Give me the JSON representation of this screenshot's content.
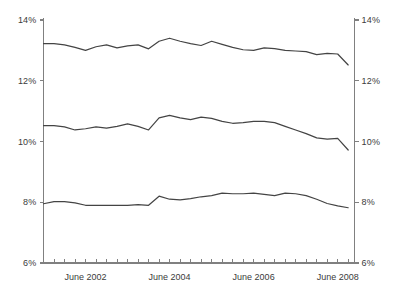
{
  "chart_data": {
    "type": "line",
    "title": "",
    "subtitle": "",
    "xlabel": "",
    "ylabel": "",
    "ylim": [
      6,
      14
    ],
    "ytick_labels": [
      "14%",
      "12%",
      "10%",
      "8%",
      "6%"
    ],
    "ytick_values": [
      14,
      12,
      10,
      8,
      6
    ],
    "ytick_labels_right": [
      "14%",
      "12%",
      "10%",
      "8%",
      "6%"
    ],
    "xtick_labels": [
      "June 2002",
      "June 2004",
      "June 2006",
      "June 2008"
    ],
    "xtick_values": [
      2002.5,
      2004.5,
      2006.5,
      2008.5
    ],
    "xlim": [
      2001.5,
      2008.9
    ],
    "grid": false,
    "legend": "none",
    "line_color": "#444444",
    "axis_color": "#808080",
    "x": [
      2001.5,
      2001.75,
      2002.0,
      2002.25,
      2002.5,
      2002.75,
      2003.0,
      2003.25,
      2003.5,
      2003.75,
      2004.0,
      2004.25,
      2004.5,
      2004.75,
      2005.0,
      2005.25,
      2005.5,
      2005.75,
      2006.0,
      2006.25,
      2006.5,
      2006.75,
      2007.0,
      2007.25,
      2007.5,
      2007.75,
      2008.0,
      2008.25,
      2008.5,
      2008.75
    ],
    "series": [
      {
        "name": "series-top",
        "values": [
          13.22,
          13.22,
          13.18,
          13.1,
          13.0,
          13.12,
          13.18,
          13.08,
          13.15,
          13.18,
          13.05,
          13.3,
          13.4,
          13.3,
          13.22,
          13.16,
          13.3,
          13.2,
          13.1,
          13.02,
          13.0,
          13.08,
          13.06,
          13.0,
          12.98,
          12.96,
          12.86,
          12.9,
          12.88,
          12.52
        ]
      },
      {
        "name": "series-middle",
        "values": [
          10.52,
          10.52,
          10.48,
          10.38,
          10.42,
          10.48,
          10.44,
          10.5,
          10.58,
          10.5,
          10.38,
          10.78,
          10.86,
          10.78,
          10.72,
          10.8,
          10.76,
          10.66,
          10.6,
          10.62,
          10.66,
          10.66,
          10.62,
          10.5,
          10.38,
          10.26,
          10.12,
          10.08,
          10.1,
          9.72
        ]
      },
      {
        "name": "series-bottom",
        "values": [
          7.95,
          8.02,
          8.02,
          7.98,
          7.9,
          7.9,
          7.9,
          7.9,
          7.9,
          7.92,
          7.9,
          8.2,
          8.1,
          8.08,
          8.12,
          8.18,
          8.22,
          8.3,
          8.28,
          8.28,
          8.3,
          8.26,
          8.22,
          8.3,
          8.28,
          8.22,
          8.1,
          7.96,
          7.88,
          7.82
        ]
      }
    ]
  },
  "axis": {
    "left_ticks": [
      "14%",
      "12%",
      "10%",
      "8%",
      "6%"
    ],
    "right_ticks": [
      "14%",
      "12%",
      "10%",
      "8%",
      "6%"
    ],
    "bottom_ticks": [
      "June 2002",
      "June 2004",
      "June 2006",
      "June 2008"
    ]
  }
}
